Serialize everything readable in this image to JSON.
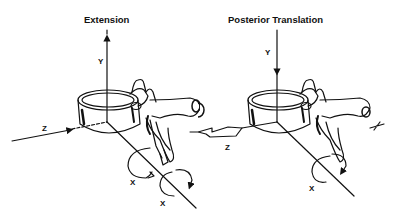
{
  "figure": {
    "panels": [
      {
        "id": "extension",
        "title": "Extension",
        "axes": {
          "y": "Y",
          "z": "Z",
          "x_upper": "X",
          "x_lower": "X"
        },
        "y_arrow_direction": "up",
        "rotation_about_x": "two circular arrows"
      },
      {
        "id": "posterior-translation",
        "title": "Posterior Translation",
        "axes": {
          "y": "Y",
          "z": "Z",
          "x": "X"
        },
        "y_arrow_direction": "down",
        "z_arrow": "double-headed translation arrow"
      }
    ],
    "colors": {
      "ink": "#111111",
      "background": "#ffffff"
    }
  }
}
